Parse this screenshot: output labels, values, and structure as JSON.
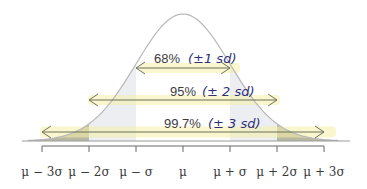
{
  "colors": {
    "curve": "#b9b9b9",
    "band1": "#eceef2",
    "band2": "#d8dbe2",
    "band3": "#b9b9a3",
    "highlight": "#f6f0a6",
    "arrow": "#6d6f5c",
    "axis": "#666666",
    "handwriting": "#2e2f78"
  },
  "axis": {
    "ticks": [
      "μ − 3σ",
      "μ − 2σ",
      "μ − σ",
      "μ",
      "μ + σ",
      "μ + 2σ",
      "μ + 3σ"
    ],
    "sd_positions": [
      -3,
      -2,
      -1,
      0,
      1,
      2,
      3
    ]
  },
  "intervals": [
    {
      "sd": 1,
      "percent": "68%",
      "note": "(±1 sd)"
    },
    {
      "sd": 2,
      "percent": "95%",
      "note": "(± 2 sd)"
    },
    {
      "sd": 3,
      "percent": "99.7%",
      "note": "(± 3 sd)"
    }
  ]
}
